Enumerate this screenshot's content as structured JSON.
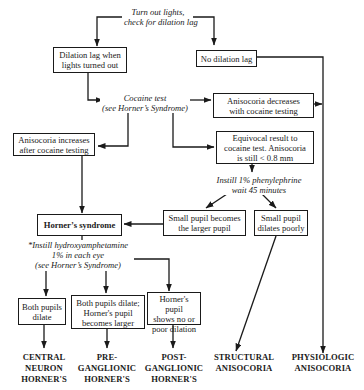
{
  "diagram": {
    "type": "flowchart",
    "topic": "Anisocoria evaluation",
    "start": {
      "lines": [
        "Turn out lights,",
        "check for dilation lag"
      ]
    },
    "boxes": {
      "dilation_lag": {
        "lines": [
          "Dilation lag when",
          "lights turned out"
        ]
      },
      "no_dilation_lag": {
        "lines": [
          "No dilation lag"
        ]
      },
      "aniso_decreases": {
        "lines": [
          "Anisocoria decreases",
          "with cocaine testing"
        ]
      },
      "aniso_increases": {
        "lines": [
          "Anisocoria increases",
          "after cocaine testing"
        ]
      },
      "equivocal": {
        "lines": [
          "Equivocal result to",
          "cocaine test.  Anisocoria",
          "is still < 0.8 mm"
        ]
      },
      "horners_syndrome": {
        "lines": [
          "Horner’s syndrome"
        ]
      },
      "small_becomes_larger": {
        "lines": [
          "Small pupil becomes",
          "the larger pupil"
        ]
      },
      "small_dilates_poorly": {
        "lines": [
          "Small pupil",
          "dilates poorly"
        ]
      },
      "both_dilate": {
        "lines": [
          "Both pupils",
          "dilate"
        ]
      },
      "both_dilate_horner_larger": {
        "lines": [
          "Both pupils dilate;",
          "Horner's pupil",
          "becomes larger"
        ]
      },
      "horner_no_dilation": {
        "lines": [
          "Horner's pupil",
          "shows no or",
          "poor dilation"
        ]
      }
    },
    "notes": {
      "cocaine_test": {
        "lines": [
          "Cocaine test",
          "(see Horner’s Syndrome)"
        ]
      },
      "phenylephrine": {
        "lines": [
          "Instill 1% phenylephrine",
          "wait 45 minutes"
        ]
      },
      "hydroxyamphetamine": {
        "lines": [
          "*Instill  hydroxyamphetamine",
          "1%  in each eye",
          "(see Horner’s Syndrome)"
        ]
      }
    },
    "outcomes": {
      "central": {
        "lines": [
          "CENTRAL",
          "NEURON",
          "HORNER'S"
        ]
      },
      "preganglionic": {
        "lines": [
          "PRE-",
          "GANGLIONIC",
          "HORNER'S"
        ]
      },
      "postganglionic": {
        "lines": [
          "POST-",
          "GANGLIONIC",
          "HORNER'S"
        ]
      },
      "structural": {
        "lines": [
          "STRUCTURAL",
          "ANISOCORIA"
        ]
      },
      "physiologic": {
        "lines": [
          "PHYSIOLOGIC",
          "ANISOCORIA"
        ]
      }
    },
    "colors": {
      "ink": "#1a1a1a",
      "background": "#ffffff"
    }
  }
}
